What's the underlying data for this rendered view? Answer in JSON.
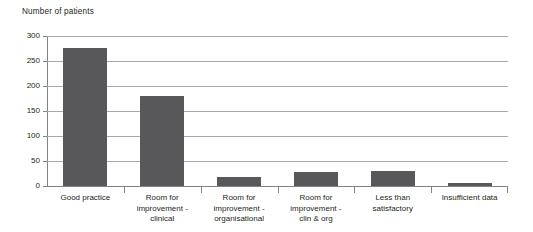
{
  "chart_data": {
    "type": "bar",
    "title": "Number of patients",
    "xlabel": "",
    "ylabel": "",
    "ylim": [
      0,
      300
    ],
    "grid": true,
    "legend": "none",
    "y_ticks": [
      "0",
      "50",
      "100",
      "150",
      "200",
      "250",
      "300"
    ],
    "y_tick_values": [
      0,
      50,
      100,
      150,
      200,
      250,
      300
    ],
    "categories": [
      "Good practice",
      "Room for improvement - clinical",
      "Room for improvement - organisational",
      "Room for improvement - clin & org",
      "Less than satisfactory",
      "Insufficient data"
    ],
    "category_lines": [
      [
        "Good practice"
      ],
      [
        "Room for",
        "improvement -",
        "clinical"
      ],
      [
        "Room for",
        "improvement -",
        "organisational"
      ],
      [
        "Room for",
        "improvement -",
        "clin & org"
      ],
      [
        "Less than",
        "satisfactory"
      ],
      [
        "Insufficient data"
      ]
    ],
    "values": [
      277,
      180,
      18,
      28,
      30,
      6
    ],
    "bar_color": "#58585a",
    "gridline_color": "#a7a9ac",
    "axis_color": "#808285",
    "text_color": "#231f20"
  }
}
